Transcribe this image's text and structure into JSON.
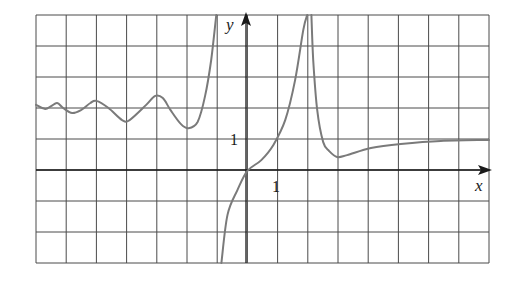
{
  "chart_data": {
    "type": "line",
    "title": "",
    "xlabel": "x",
    "ylabel": "y",
    "x_tick_labels": [
      {
        "value": 1,
        "label": "1"
      }
    ],
    "y_tick_labels": [
      {
        "value": 1,
        "label": "1"
      }
    ],
    "xlim": [
      -7,
      8
    ],
    "ylim": [
      -3,
      5
    ],
    "grid": true,
    "grid_step": 1,
    "legend": null,
    "curve_color": "#7a7a7a",
    "grid_color": "#4a4a4a",
    "vertical_asymptotes": [
      -1.1,
      2.0
    ],
    "horizontal_asymptote": 1.0,
    "series": [
      {
        "name": "left branch",
        "points": [
          [
            -7.0,
            2.1
          ],
          [
            -6.7,
            1.97
          ],
          [
            -6.5,
            2.06
          ],
          [
            -6.3,
            2.16
          ],
          [
            -6.1,
            2.0
          ],
          [
            -5.8,
            1.84
          ],
          [
            -5.5,
            1.94
          ],
          [
            -5.2,
            2.16
          ],
          [
            -5.0,
            2.23
          ],
          [
            -4.6,
            2.0
          ],
          [
            -4.15,
            1.61
          ],
          [
            -3.9,
            1.61
          ],
          [
            -3.35,
            2.1
          ],
          [
            -3.05,
            2.39
          ],
          [
            -2.8,
            2.32
          ],
          [
            -2.55,
            1.94
          ],
          [
            -2.2,
            1.48
          ],
          [
            -1.95,
            1.35
          ],
          [
            -1.65,
            1.55
          ],
          [
            -1.4,
            2.39
          ],
          [
            -1.2,
            3.55
          ],
          [
            -1.03,
            5.0
          ]
        ]
      },
      {
        "name": "middle branch",
        "points": [
          [
            -0.86,
            -3.0
          ],
          [
            -0.66,
            -1.45
          ],
          [
            -0.33,
            -0.65
          ],
          [
            0.0,
            -0.03
          ],
          [
            0.46,
            0.32
          ],
          [
            0.86,
            0.81
          ],
          [
            1.25,
            1.61
          ],
          [
            1.58,
            2.9
          ],
          [
            1.85,
            4.52
          ],
          [
            1.98,
            5.0
          ]
        ]
      },
      {
        "name": "right branch",
        "points": [
          [
            2.12,
            5.0
          ],
          [
            2.18,
            3.55
          ],
          [
            2.31,
            1.94
          ],
          [
            2.51,
            0.9
          ],
          [
            2.71,
            0.61
          ],
          [
            2.97,
            0.42
          ],
          [
            3.3,
            0.48
          ],
          [
            4.09,
            0.71
          ],
          [
            5.08,
            0.84
          ],
          [
            6.4,
            0.94
          ],
          [
            8.0,
            0.97
          ]
        ]
      }
    ]
  },
  "labels": {
    "x_axis": "x",
    "y_axis": "y",
    "x_tick": "1",
    "y_tick": "1"
  }
}
